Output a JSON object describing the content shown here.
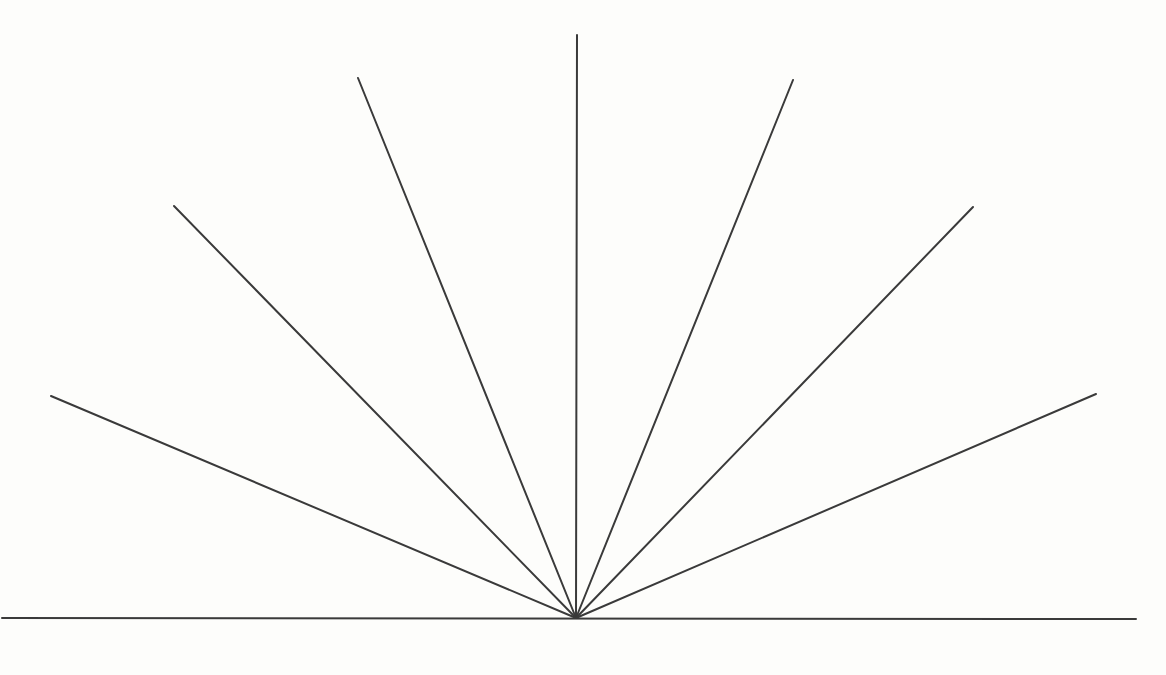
{
  "figure": {
    "canvas": {
      "width": 1166,
      "height": 675
    },
    "background_color": "#fdfdfb",
    "line_color": "#3a3a3a",
    "stroke_width": 2,
    "vertex": {
      "x": 576,
      "y": 618
    },
    "baseline": {
      "name": "baseline",
      "x1": 2,
      "y1": 618,
      "x2": 1136,
      "y2": 619
    },
    "rays": [
      {
        "name": "ray-left-23deg",
        "angle_deg": 23,
        "side": "left",
        "x2": 51,
        "y2": 396
      },
      {
        "name": "ray-left-46deg",
        "angle_deg": 46,
        "side": "left",
        "x2": 174,
        "y2": 206
      },
      {
        "name": "ray-left-68deg",
        "angle_deg": 68,
        "side": "left",
        "x2": 358,
        "y2": 78
      },
      {
        "name": "ray-vertical-90deg",
        "angle_deg": 90,
        "side": "center",
        "x2": 577,
        "y2": 35
      },
      {
        "name": "ray-right-68deg",
        "angle_deg": 68,
        "side": "right",
        "x2": 793,
        "y2": 80
      },
      {
        "name": "ray-right-46deg",
        "angle_deg": 46,
        "side": "right",
        "x2": 973,
        "y2": 207
      },
      {
        "name": "ray-right-23deg",
        "angle_deg": 23,
        "side": "right",
        "x2": 1096,
        "y2": 394
      }
    ]
  }
}
